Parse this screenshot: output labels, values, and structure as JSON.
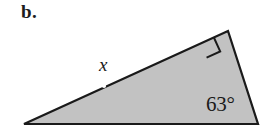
{
  "figure": {
    "part_label": "b.",
    "shape": "right-triangle",
    "fill_color": "#c2c2c2",
    "stroke_color": "#1a1a1a",
    "background_color": "#ffffff",
    "vertices": {
      "left": [
        24,
        124
      ],
      "top_right": [
        228,
        31
      ],
      "bottom_right": [
        258,
        124
      ]
    },
    "labels": {
      "side_x": "x",
      "angle_bottom_right": "63°"
    },
    "markers": {
      "right_angle_vertex": "top_right",
      "right_angle_square_size": 15,
      "midpoint_dot": [
        104,
        86
      ]
    }
  }
}
